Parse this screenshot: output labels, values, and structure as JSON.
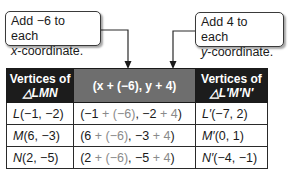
{
  "callouts": {
    "left": {
      "line1": "Add −6 to each",
      "line2_var": "x",
      "line2_rest": "-coordinate."
    },
    "right": {
      "line1": "Add 4 to each",
      "line2_var": "y",
      "line2_rest": "-coordinate."
    }
  },
  "table": {
    "headers": {
      "col1_line1": "Vertices of",
      "col1_line2": "△LMN",
      "col2": "(x + (−6), y + 4)",
      "col3_line1": "Vertices of",
      "col3_line2": "△L′M′N′"
    },
    "rows": [
      {
        "vertex_label": "L",
        "vertex_coords": "(−1, −2)",
        "expr_open": "(−1",
        "expr_add_x": " + (−6)",
        "expr_mid": ", −2",
        "expr_add_y": " + 4",
        "expr_close": ")",
        "image_label": "L′",
        "image_coords": "(−7, 2)"
      },
      {
        "vertex_label": "M",
        "vertex_coords": "(6, −3)",
        "expr_open": "(6",
        "expr_add_x": " + (−6)",
        "expr_mid": ", −3",
        "expr_add_y": " + 4",
        "expr_close": ")",
        "image_label": "M′",
        "image_coords": "(0, 1)"
      },
      {
        "vertex_label": "N",
        "vertex_coords": "(2, −5)",
        "expr_open": "(2",
        "expr_add_x": " + (−6)",
        "expr_mid": ", −5",
        "expr_add_y": " + 4",
        "expr_close": ")",
        "image_label": "N′",
        "image_coords": "(−4, −1)"
      }
    ]
  },
  "colors": {
    "header_dark": "#1c1c1c",
    "header_mid": "#6e6e6e",
    "added_term": "#8a8a8a"
  }
}
